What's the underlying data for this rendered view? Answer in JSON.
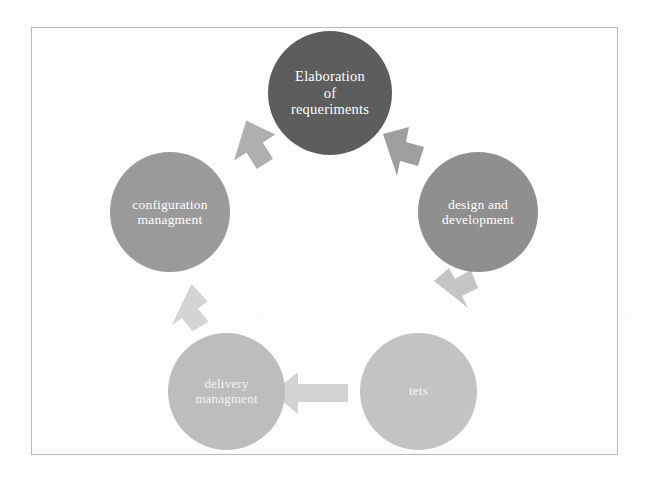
{
  "diagram": {
    "frame": {
      "style": "thin rectangular border"
    },
    "nodes": [
      {
        "id": "requirements",
        "label": "Elaboration\nof\nrequeriments",
        "label_lines": [
          "Elaboration",
          "of",
          "requeriments"
        ],
        "color": "#5d5d5d",
        "position": "top"
      },
      {
        "id": "design",
        "label": "design and\ndevelopment",
        "label_lines": [
          "design and",
          "development"
        ],
        "color": "#8f8f8f",
        "position": "right"
      },
      {
        "id": "tests",
        "label": "tets",
        "label_lines": [
          "tets"
        ],
        "color": "#c3c3c3",
        "position": "bottom-right"
      },
      {
        "id": "delivery",
        "label": "delivery\nmanagment",
        "label_lines": [
          "delivery",
          "managment"
        ],
        "color": "#bdbdbd",
        "position": "bottom-left"
      },
      {
        "id": "configuration",
        "label": "configuration\nmanagment",
        "label_lines": [
          "configuration",
          "managment"
        ],
        "color": "#9a9a9a",
        "position": "left"
      }
    ],
    "arrows": [
      {
        "id": "configuration-to-requirements",
        "from": "configuration",
        "to": "requirements",
        "direction": "up-right",
        "color": "#a8a8a8"
      },
      {
        "id": "requirements-to-design",
        "from": "requirements",
        "to": "design",
        "direction": "down-right",
        "color": "#969696"
      },
      {
        "id": "design-to-tests",
        "from": "design",
        "to": "tests",
        "direction": "down",
        "color": "#c0c0c0"
      },
      {
        "id": "tests-to-delivery",
        "from": "tests",
        "to": "delivery",
        "direction": "left",
        "color": "#cfcfcf"
      },
      {
        "id": "delivery-to-configuration",
        "from": "delivery",
        "to": "configuration",
        "direction": "up",
        "color": "#d2d2d2"
      }
    ]
  }
}
